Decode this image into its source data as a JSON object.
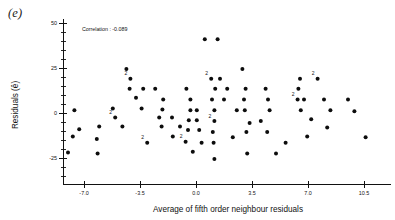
{
  "figure": {
    "panel_label": "(e)",
    "annotation": "Correlation : -0.089"
  },
  "chart_data": {
    "type": "scatter",
    "title": "",
    "xlabel": "Average of fifth order neighbour residuals",
    "ylabel": "Residuals (ê)",
    "annotation": "Correlation : -0.089",
    "correlation": -0.089,
    "xlim": [
      -8.8,
      12.2
    ],
    "ylim": [
      -38,
      52
    ],
    "xticks": [
      -7.0,
      -3.5,
      0.0,
      3.5,
      7.0,
      10.5
    ],
    "xtick_labels": [
      "-7.0",
      "-3.5",
      "0.0",
      "3.5",
      "7.0",
      "10.5"
    ],
    "yticks": [
      -25,
      0,
      25,
      50
    ],
    "ytick_labels": [
      "-25",
      "0",
      "25",
      "50"
    ],
    "y_minor_step": 5,
    "grid": false,
    "legend": false,
    "marker": "filled-circle",
    "duplicate_marker_label": "2",
    "points": [
      {
        "x": -4.35,
        "y": 24.5,
        "n": 1
      },
      {
        "x": -4.1,
        "y": 19.0,
        "n": 2
      },
      {
        "x": -4.15,
        "y": 13.5,
        "n": 1
      },
      {
        "x": -3.3,
        "y": 13.5,
        "n": 1
      },
      {
        "x": -3.75,
        "y": 8.5,
        "n": 1
      },
      {
        "x": -5.2,
        "y": 2.5,
        "n": 1
      },
      {
        "x": -3.4,
        "y": 2.5,
        "n": 1
      },
      {
        "x": -5.05,
        "y": -2.5,
        "n": 2
      },
      {
        "x": -6.05,
        "y": -7.5,
        "n": 1
      },
      {
        "x": -4.6,
        "y": -7.5,
        "n": 1
      },
      {
        "x": -6.2,
        "y": -14.5,
        "n": 1
      },
      {
        "x": -6.15,
        "y": -22.5,
        "n": 1
      },
      {
        "x": -2.55,
        "y": 13.5,
        "n": 1
      },
      {
        "x": -2.05,
        "y": 7.5,
        "n": 1
      },
      {
        "x": -2.1,
        "y": 2.0,
        "n": 1
      },
      {
        "x": -2.3,
        "y": -2.5,
        "n": 1
      },
      {
        "x": -1.5,
        "y": -2.5,
        "n": 1
      },
      {
        "x": -2.15,
        "y": -7.5,
        "n": 1
      },
      {
        "x": -1.0,
        "y": -7.5,
        "n": 1
      },
      {
        "x": -1.45,
        "y": -13.0,
        "n": 1
      },
      {
        "x": -0.6,
        "y": 13.5,
        "n": 1
      },
      {
        "x": -0.35,
        "y": 7.5,
        "n": 1
      },
      {
        "x": -0.35,
        "y": 1.5,
        "n": 1
      },
      {
        "x": 0.05,
        "y": 1.5,
        "n": 1
      },
      {
        "x": -0.45,
        "y": -4.0,
        "n": 1
      },
      {
        "x": 0.05,
        "y": -4.0,
        "n": 1
      },
      {
        "x": -0.5,
        "y": -9.5,
        "n": 1
      },
      {
        "x": 0.2,
        "y": -9.5,
        "n": 1
      },
      {
        "x": -0.65,
        "y": -16.0,
        "n": 2
      },
      {
        "x": -0.2,
        "y": -21.5,
        "n": 1
      },
      {
        "x": 0.55,
        "y": 41.0,
        "n": 1
      },
      {
        "x": 1.35,
        "y": 41.0,
        "n": 1
      },
      {
        "x": 0.95,
        "y": 19.0,
        "n": 2
      },
      {
        "x": 1.5,
        "y": 19.0,
        "n": 1
      },
      {
        "x": 1.2,
        "y": 13.5,
        "n": 1
      },
      {
        "x": 1.95,
        "y": 13.5,
        "n": 1
      },
      {
        "x": 1.0,
        "y": 7.5,
        "n": 1
      },
      {
        "x": 1.75,
        "y": 7.5,
        "n": 1
      },
      {
        "x": 1.15,
        "y": 1.5,
        "n": 1
      },
      {
        "x": 1.15,
        "y": -4.5,
        "n": 2
      },
      {
        "x": 1.05,
        "y": -10.5,
        "n": 1
      },
      {
        "x": 1.1,
        "y": -16.5,
        "n": 1
      },
      {
        "x": 1.15,
        "y": -25.5,
        "n": 1
      },
      {
        "x": 2.9,
        "y": 24.5,
        "n": 1
      },
      {
        "x": 3.1,
        "y": 13.5,
        "n": 1
      },
      {
        "x": 3.0,
        "y": 7.5,
        "n": 1
      },
      {
        "x": 3.05,
        "y": 1.5,
        "n": 1
      },
      {
        "x": 3.35,
        "y": -5.5,
        "n": 1
      },
      {
        "x": 3.15,
        "y": -10.5,
        "n": 1
      },
      {
        "x": 3.2,
        "y": -22.5,
        "n": 1
      },
      {
        "x": 4.35,
        "y": 13.5,
        "n": 1
      },
      {
        "x": 4.5,
        "y": 7.5,
        "n": 1
      },
      {
        "x": 4.6,
        "y": 1.5,
        "n": 1
      },
      {
        "x": 4.05,
        "y": -4.5,
        "n": 1
      },
      {
        "x": 4.45,
        "y": -10.5,
        "n": 1
      },
      {
        "x": 5.0,
        "y": -22.5,
        "n": 1
      },
      {
        "x": 6.5,
        "y": 19.0,
        "n": 1
      },
      {
        "x": 6.4,
        "y": 13.5,
        "n": 1
      },
      {
        "x": 6.35,
        "y": 7.5,
        "n": 2
      },
      {
        "x": 6.75,
        "y": 7.5,
        "n": 1
      },
      {
        "x": 6.55,
        "y": 1.5,
        "n": 1
      },
      {
        "x": 7.2,
        "y": -3.5,
        "n": 1
      },
      {
        "x": 6.95,
        "y": -13.0,
        "n": 1
      },
      {
        "x": 7.6,
        "y": 19.0,
        "n": 2
      },
      {
        "x": 8.0,
        "y": 7.5,
        "n": 1
      },
      {
        "x": 8.4,
        "y": 1.5,
        "n": 1
      },
      {
        "x": 8.2,
        "y": -8.0,
        "n": 1
      },
      {
        "x": 9.5,
        "y": 7.5,
        "n": 1
      },
      {
        "x": 9.9,
        "y": 1.0,
        "n": 1
      },
      {
        "x": 10.6,
        "y": -13.5,
        "n": 1
      },
      {
        "x": -7.6,
        "y": 1.5,
        "n": 1
      },
      {
        "x": -7.3,
        "y": -9.0,
        "n": 1
      },
      {
        "x": -7.7,
        "y": -13.0,
        "n": 1
      },
      {
        "x": -8.0,
        "y": -22.0,
        "n": 1
      },
      {
        "x": 2.3,
        "y": -13.5,
        "n": 1
      },
      {
        "x": 5.6,
        "y": -16.5,
        "n": 1
      },
      {
        "x": 2.55,
        "y": 1.5,
        "n": 1
      },
      {
        "x": -3.05,
        "y": -16.5,
        "n": 2
      },
      {
        "x": 0.35,
        "y": -16.5,
        "n": 1
      }
    ]
  }
}
